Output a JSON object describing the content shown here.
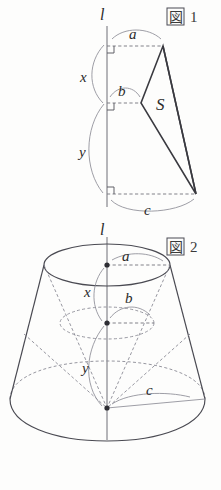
{
  "page": {
    "background_color": "#fdfdfc",
    "ink_color": "#4a4a52"
  },
  "figures": [
    {
      "id": "figure-1",
      "tag_kanji": "図",
      "tag_number": "1",
      "axis_label": "l",
      "area_label": "S",
      "labels": {
        "top_radius": "a",
        "mid_radius": "b",
        "bottom_radius": "c",
        "upper_height": "x",
        "lower_height": "y"
      },
      "right_angle_count": 3
    },
    {
      "id": "figure-2",
      "tag_kanji": "図",
      "tag_number": "2",
      "axis_label": "l",
      "labels": {
        "top_radius": "a",
        "mid_radius": "b",
        "bottom_radius": "c",
        "upper_height": "x",
        "lower_height": "y"
      },
      "center_dot_count": 3
    }
  ]
}
